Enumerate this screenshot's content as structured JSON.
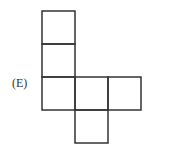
{
  "option_label": "(E)",
  "diagram": {
    "type": "cube-net",
    "cell_size": 33,
    "line_color": "#333333",
    "cells": [
      {
        "col": 0,
        "row": 0
      },
      {
        "col": 0,
        "row": 1
      },
      {
        "col": 0,
        "row": 2
      },
      {
        "col": 1,
        "row": 2
      },
      {
        "col": 2,
        "row": 2
      },
      {
        "col": 1,
        "row": 3
      }
    ]
  }
}
